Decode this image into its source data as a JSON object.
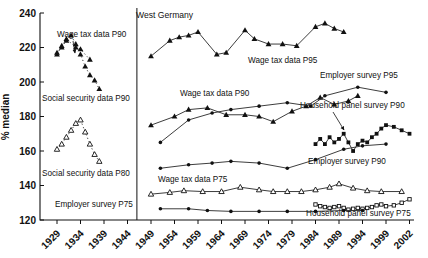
{
  "chart_data": {
    "type": "line",
    "panel_label": "West Germany",
    "ylabel": "% median",
    "ylim": [
      120,
      240
    ],
    "yticks": [
      120,
      140,
      160,
      180,
      200,
      220,
      240
    ],
    "xtick_years": [
      1929,
      1934,
      1939,
      1944,
      1949,
      1954,
      1959,
      1964,
      1969,
      1974,
      1979,
      1984,
      1989,
      1994,
      1999,
      2002
    ],
    "grid": false,
    "panel_divider_year": 1946,
    "legend_style": "inline-annotations",
    "series": [
      {
        "name": "wage-tax-data-p90-prewar",
        "label": "Wage tax data P90",
        "panel": "left",
        "marker": "triangle-filled",
        "line": "dotted",
        "points": [
          [
            1929,
            216
          ],
          [
            1930,
            221
          ],
          [
            1931,
            225
          ],
          [
            1933,
            220
          ],
          [
            1934,
            219
          ],
          [
            1936,
            213
          ]
        ]
      },
      {
        "name": "social-security-data-p90",
        "label": "Social security data P90",
        "panel": "left",
        "marker": "triangle-filled",
        "line": "dotted",
        "points": [
          [
            1929,
            217
          ],
          [
            1930,
            220
          ],
          [
            1931,
            224
          ],
          [
            1932,
            227
          ],
          [
            1933,
            222
          ],
          [
            1934,
            216
          ],
          [
            1935,
            209
          ],
          [
            1936,
            204
          ],
          [
            1937,
            201
          ],
          [
            1938,
            196
          ]
        ]
      },
      {
        "name": "social-security-data-p80",
        "label": "Social security data P80",
        "panel": "left",
        "marker": "triangle-open",
        "line": "dotted",
        "points": [
          [
            1929,
            161
          ],
          [
            1930,
            164
          ],
          [
            1931,
            168
          ],
          [
            1932,
            172
          ],
          [
            1933,
            176
          ],
          [
            1934,
            178
          ],
          [
            1935,
            171
          ],
          [
            1936,
            164
          ],
          [
            1937,
            158
          ],
          [
            1938,
            154
          ]
        ]
      },
      {
        "name": "wage-tax-data-p95",
        "label": "Wage tax data P95",
        "panel": "right",
        "marker": "triangle-filled",
        "line": "solid",
        "points": [
          [
            1949,
            215
          ],
          [
            1953,
            224
          ],
          [
            1955,
            226
          ],
          [
            1957,
            227
          ],
          [
            1959,
            229
          ],
          [
            1963,
            216
          ],
          [
            1965,
            217
          ],
          [
            1969,
            230
          ],
          [
            1971,
            225
          ],
          [
            1974,
            222
          ],
          [
            1977,
            222
          ],
          [
            1980,
            221
          ],
          [
            1984,
            232
          ],
          [
            1986,
            234
          ],
          [
            1988,
            231
          ],
          [
            1990,
            229
          ]
        ]
      },
      {
        "name": "wage-tax-data-p90",
        "label": "Wage tax data P90",
        "panel": "right",
        "marker": "triangle-filled",
        "line": "solid",
        "points": [
          [
            1949,
            175
          ],
          [
            1954,
            180
          ],
          [
            1957,
            184
          ],
          [
            1961,
            185
          ],
          [
            1965,
            181
          ],
          [
            1969,
            181
          ],
          [
            1972,
            180
          ],
          [
            1975,
            177
          ],
          [
            1979,
            183
          ],
          [
            1982,
            186
          ],
          [
            1985,
            191
          ],
          [
            1988,
            187
          ],
          [
            1991,
            189
          ],
          [
            1993,
            192
          ]
        ]
      },
      {
        "name": "employer-survey-p95",
        "label": "Employer survey P95",
        "panel": "right",
        "marker": "circle-filled",
        "line": "solid",
        "points": [
          [
            1951,
            165
          ],
          [
            1957,
            178
          ],
          [
            1962,
            182
          ],
          [
            1966,
            184
          ],
          [
            1972,
            186
          ],
          [
            1978,
            188
          ],
          [
            1983,
            186
          ],
          [
            1986,
            192
          ],
          [
            1993,
            197
          ],
          [
            1999,
            194
          ]
        ]
      },
      {
        "name": "employer-survey-p90",
        "label": "Employer survey P90",
        "panel": "right",
        "marker": "circle-filled",
        "line": "solid",
        "points": [
          [
            1951,
            150
          ],
          [
            1957,
            152
          ],
          [
            1962,
            153
          ],
          [
            1966,
            154
          ],
          [
            1972,
            153
          ],
          [
            1978,
            150
          ],
          [
            1984,
            155
          ],
          [
            1990,
            161
          ],
          [
            1994,
            163
          ],
          [
            1999,
            164
          ]
        ]
      },
      {
        "name": "wage-tax-data-p75",
        "label": "Wage tax data P75",
        "panel": "right",
        "marker": "triangle-open",
        "line": "solid",
        "points": [
          [
            1949,
            135
          ],
          [
            1953,
            136
          ],
          [
            1956,
            137
          ],
          [
            1960,
            136.5
          ],
          [
            1964,
            136.5
          ],
          [
            1968,
            139
          ],
          [
            1972,
            137.5
          ],
          [
            1975,
            136.5
          ],
          [
            1978,
            136.5
          ],
          [
            1981,
            136.5
          ],
          [
            1984,
            137.5
          ],
          [
            1987,
            139
          ],
          [
            1989,
            141
          ],
          [
            1992,
            138.5
          ],
          [
            1995,
            137
          ],
          [
            1998,
            136.5
          ],
          [
            2001,
            136.5
          ]
        ]
      },
      {
        "name": "household-panel-survey-p90",
        "label": "Household panel survey P90",
        "panel": "right",
        "marker": "square-filled",
        "line": "solid",
        "points": [
          [
            1984,
            164
          ],
          [
            1985,
            167
          ],
          [
            1986,
            164
          ],
          [
            1987,
            168
          ],
          [
            1988,
            165
          ],
          [
            1989,
            167
          ],
          [
            1990,
            170
          ],
          [
            1991,
            165
          ],
          [
            1992,
            160
          ],
          [
            1993,
            164
          ],
          [
            1994,
            166
          ],
          [
            1995,
            165
          ],
          [
            1996,
            168
          ],
          [
            1997,
            170
          ],
          [
            1998,
            173
          ],
          [
            1999,
            175
          ],
          [
            2000,
            174
          ],
          [
            2001,
            172
          ],
          [
            2002,
            170
          ]
        ]
      },
      {
        "name": "household-panel-survey-p75",
        "label": "Household panel survey P75",
        "panel": "right",
        "marker": "square-open",
        "line": "solid",
        "points": [
          [
            1984,
            129
          ],
          [
            1985,
            128
          ],
          [
            1986,
            127.5
          ],
          [
            1987,
            127
          ],
          [
            1988,
            127.5
          ],
          [
            1989,
            128
          ],
          [
            1990,
            127
          ],
          [
            1991,
            126
          ],
          [
            1992,
            126.5
          ],
          [
            1993,
            127
          ],
          [
            1994,
            126.5
          ],
          [
            1995,
            127
          ],
          [
            1996,
            127.5
          ],
          [
            1997,
            128.5
          ],
          [
            1998,
            129
          ],
          [
            1999,
            128
          ],
          [
            2000,
            128.5
          ],
          [
            2001,
            130
          ],
          [
            2002,
            132
          ]
        ]
      },
      {
        "name": "employer-survey-p75",
        "label": "Employer survey P75",
        "panel": "right",
        "marker": "circle-filled",
        "line": "solid",
        "points": [
          [
            1951,
            126.5
          ],
          [
            1957,
            126.5
          ],
          [
            1961,
            125.5
          ],
          [
            1966,
            125
          ],
          [
            1972,
            125
          ],
          [
            1978,
            125
          ],
          [
            1984,
            125
          ],
          [
            1990,
            125.5
          ],
          [
            1994,
            125.5
          ]
        ]
      }
    ],
    "annotations": [
      {
        "text": "Wage tax data P90",
        "x": 57,
        "y": 37,
        "arrow": {
          "x1": 73,
          "y1": 41,
          "x2": 75,
          "y2": 53
        }
      },
      {
        "text": "Social security data P90",
        "x": 42,
        "y": 101
      },
      {
        "text": "Social security data P80",
        "x": 42,
        "y": 176
      },
      {
        "text": "Employer survey P75",
        "x": 55,
        "y": 207
      },
      {
        "text": "West Germany",
        "x": 136,
        "y": 18
      },
      {
        "text": "Wage tax data P95",
        "x": 248,
        "y": 63
      },
      {
        "text": "Wage tax data P90",
        "x": 180,
        "y": 96
      },
      {
        "text": "Employer survey P95",
        "x": 320,
        "y": 78
      },
      {
        "text": "Household panel survey P90",
        "x": 300,
        "y": 108,
        "arrow": {
          "x1": 333,
          "y1": 112,
          "x2": 344,
          "y2": 130
        }
      },
      {
        "text": "Employer survey P90",
        "x": 308,
        "y": 164
      },
      {
        "text": "Wage tax data P75",
        "x": 158,
        "y": 182
      },
      {
        "text": "Household panel survey P75",
        "x": 306,
        "y": 216
      }
    ],
    "colors": {
      "line": "#333333",
      "marker": "#111111",
      "text": "#111111"
    }
  }
}
